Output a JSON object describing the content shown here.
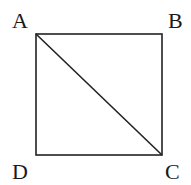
{
  "figure": {
    "shape": "square",
    "stroke_color": "#222222",
    "background": "#ffffff",
    "vertices": {
      "A": {
        "label": "A",
        "x": 36,
        "y": 34
      },
      "B": {
        "label": "B",
        "x": 162,
        "y": 34
      },
      "C": {
        "label": "C",
        "x": 162,
        "y": 155
      },
      "D": {
        "label": "D",
        "x": 36,
        "y": 155
      }
    },
    "segments": [
      "AB",
      "BC",
      "CD",
      "DA",
      "AC"
    ],
    "diagonal": "AC"
  }
}
